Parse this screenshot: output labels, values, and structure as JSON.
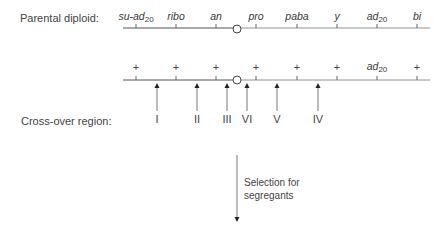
{
  "labels": {
    "parental": "Parental diploid:",
    "crossover": "Cross-over region:",
    "selection_line1": "Selection for",
    "selection_line2": "segregants"
  },
  "chromosome_top": {
    "genes": [
      {
        "name": "su-ad",
        "sub": "20",
        "x": 136
      },
      {
        "name": "ribo",
        "sub": "",
        "x": 176
      },
      {
        "name": "an",
        "sub": "",
        "x": 216
      },
      {
        "name": "pro",
        "sub": "",
        "x": 256
      },
      {
        "name": "paba",
        "sub": "",
        "x": 297
      },
      {
        "name": "y",
        "sub": "",
        "x": 337
      },
      {
        "name": "ad",
        "sub": "20",
        "x": 377
      },
      {
        "name": "bi",
        "sub": "",
        "x": 417
      }
    ],
    "centromere_x": 237
  },
  "chromosome_bottom": {
    "alleles": [
      {
        "text": "+",
        "x": 136
      },
      {
        "text": "+",
        "x": 176
      },
      {
        "text": "+",
        "x": 216
      },
      {
        "text": "+",
        "x": 256
      },
      {
        "text": "+",
        "x": 297
      },
      {
        "text": "+",
        "x": 337
      },
      {
        "text": "ad",
        "sub": "20",
        "x": 377
      },
      {
        "text": "+",
        "x": 417
      }
    ],
    "centromere_x": 237
  },
  "crossover_regions": [
    {
      "label": "I",
      "x": 157
    },
    {
      "label": "II",
      "x": 197
    },
    {
      "label": "III",
      "x": 227
    },
    {
      "label": "VI",
      "x": 247
    },
    {
      "label": "V",
      "x": 277
    },
    {
      "label": "IV",
      "x": 318
    }
  ],
  "colors": {
    "line": "#555555",
    "text": "#3a3a3a"
  }
}
